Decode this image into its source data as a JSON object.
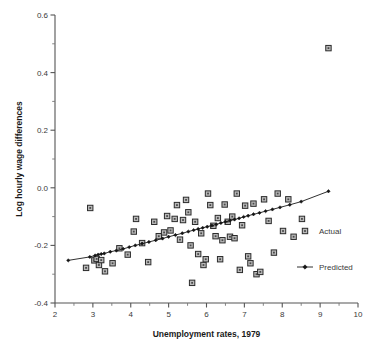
{
  "chart_data": {
    "type": "scatter",
    "title": "",
    "xlabel": "Unemployment rates, 1979",
    "ylabel": "Log hourly wage differences",
    "xlim": [
      2,
      10
    ],
    "ylim": [
      -0.4,
      0.6
    ],
    "x_ticks": [
      2,
      3,
      4,
      5,
      6,
      7,
      8,
      9,
      10
    ],
    "x_tick_labels": [
      "2",
      "3",
      "4",
      "5",
      "6",
      "7",
      "8",
      "9",
      "10"
    ],
    "x_minor_step": 0.5,
    "y_ticks": [
      -0.4,
      -0.2,
      0.0,
      0.2,
      0.4,
      0.6
    ],
    "y_tick_labels": [
      "-0.4",
      "-0.2",
      "0.0",
      "0.2",
      "0.4",
      "0.6"
    ],
    "y_minor_step": 0.1,
    "grid": false,
    "legend_position": "right-bottom",
    "series": [
      {
        "name": "Actual",
        "marker": "square",
        "type": "scatter",
        "points": [
          [
            2.82,
            -0.278
          ],
          [
            2.93,
            -0.07
          ],
          [
            3.04,
            -0.252
          ],
          [
            3.1,
            -0.247
          ],
          [
            3.16,
            -0.268
          ],
          [
            3.22,
            -0.251
          ],
          [
            3.32,
            -0.29
          ],
          [
            3.52,
            -0.262
          ],
          [
            3.7,
            -0.21
          ],
          [
            3.92,
            -0.232
          ],
          [
            4.08,
            -0.152
          ],
          [
            4.14,
            -0.108
          ],
          [
            4.3,
            -0.192
          ],
          [
            4.46,
            -0.258
          ],
          [
            4.62,
            -0.118
          ],
          [
            4.74,
            -0.168
          ],
          [
            4.88,
            -0.155
          ],
          [
            4.96,
            -0.098
          ],
          [
            5.05,
            -0.148
          ],
          [
            5.16,
            -0.108
          ],
          [
            5.22,
            -0.06
          ],
          [
            5.3,
            -0.18
          ],
          [
            5.38,
            -0.112
          ],
          [
            5.46,
            -0.042
          ],
          [
            5.52,
            -0.085
          ],
          [
            5.58,
            -0.2
          ],
          [
            5.62,
            -0.33
          ],
          [
            5.7,
            -0.118
          ],
          [
            5.78,
            -0.23
          ],
          [
            5.86,
            -0.158
          ],
          [
            5.92,
            -0.268
          ],
          [
            5.98,
            -0.248
          ],
          [
            6.04,
            -0.02
          ],
          [
            6.1,
            -0.06
          ],
          [
            6.18,
            -0.132
          ],
          [
            6.24,
            -0.168
          ],
          [
            6.3,
            -0.105
          ],
          [
            6.36,
            -0.248
          ],
          [
            6.42,
            -0.182
          ],
          [
            6.48,
            -0.058
          ],
          [
            6.56,
            -0.118
          ],
          [
            6.62,
            -0.17
          ],
          [
            6.68,
            -0.1
          ],
          [
            6.74,
            -0.175
          ],
          [
            6.8,
            -0.02
          ],
          [
            6.88,
            -0.285
          ],
          [
            6.94,
            -0.13
          ],
          [
            7.02,
            -0.062
          ],
          [
            7.1,
            -0.238
          ],
          [
            7.16,
            -0.262
          ],
          [
            7.24,
            -0.055
          ],
          [
            7.32,
            -0.3
          ],
          [
            7.42,
            -0.292
          ],
          [
            7.52,
            -0.04
          ],
          [
            7.64,
            -0.115
          ],
          [
            7.78,
            -0.225
          ],
          [
            7.88,
            -0.02
          ],
          [
            8.02,
            -0.15
          ],
          [
            8.16,
            -0.04
          ],
          [
            8.3,
            -0.17
          ],
          [
            8.52,
            -0.108
          ],
          [
            9.22,
            0.485
          ]
        ]
      },
      {
        "name": "Predicted",
        "marker": "diamond",
        "type": "line",
        "points": [
          [
            2.35,
            -0.252
          ],
          [
            2.92,
            -0.24
          ],
          [
            3.06,
            -0.235
          ],
          [
            3.14,
            -0.232
          ],
          [
            3.22,
            -0.23
          ],
          [
            3.3,
            -0.228
          ],
          [
            3.46,
            -0.222
          ],
          [
            3.62,
            -0.218
          ],
          [
            3.8,
            -0.212
          ],
          [
            3.96,
            -0.206
          ],
          [
            4.12,
            -0.2
          ],
          [
            4.3,
            -0.194
          ],
          [
            4.48,
            -0.188
          ],
          [
            4.66,
            -0.182
          ],
          [
            4.84,
            -0.176
          ],
          [
            5.0,
            -0.17
          ],
          [
            5.18,
            -0.164
          ],
          [
            5.36,
            -0.158
          ],
          [
            5.52,
            -0.152
          ],
          [
            5.66,
            -0.147
          ],
          [
            5.78,
            -0.143
          ],
          [
            5.9,
            -0.139
          ],
          [
            6.02,
            -0.135
          ],
          [
            6.14,
            -0.131
          ],
          [
            6.26,
            -0.127
          ],
          [
            6.38,
            -0.122
          ],
          [
            6.5,
            -0.118
          ],
          [
            6.62,
            -0.114
          ],
          [
            6.74,
            -0.11
          ],
          [
            6.86,
            -0.106
          ],
          [
            6.98,
            -0.101
          ],
          [
            7.1,
            -0.097
          ],
          [
            7.24,
            -0.092
          ],
          [
            7.4,
            -0.087
          ],
          [
            7.56,
            -0.081
          ],
          [
            7.74,
            -0.075
          ],
          [
            7.94,
            -0.068
          ],
          [
            8.2,
            -0.059
          ],
          [
            8.5,
            -0.048
          ],
          [
            9.22,
            -0.012
          ]
        ]
      }
    ],
    "legend": [
      {
        "label": "Actual",
        "marker": "square"
      },
      {
        "label": "Predicted",
        "marker": "line-diamond"
      }
    ],
    "colors": {
      "marker_fill": "#b9b9b9",
      "marker_stroke": "#2b2b2b",
      "line": "#1a1a1a",
      "axis": "#555555",
      "text": "#3a3a3a",
      "background": "#ffffff"
    }
  }
}
